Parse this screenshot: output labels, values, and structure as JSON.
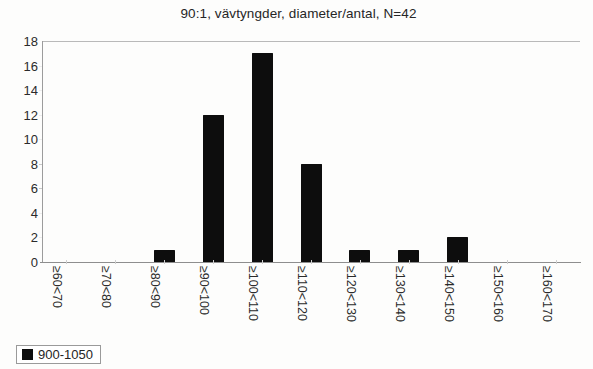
{
  "chart_data": {
    "type": "bar",
    "title": "90:1, vävtyngder, diameter/antal, N=42",
    "xlabel": "",
    "ylabel": "",
    "categories": [
      "≥60<70",
      "≥70<80",
      "≥80<90",
      "≥90<100",
      "≥100<110",
      "≥110<120",
      "≥120<130",
      "≥130<140",
      "≥140<150",
      "≥150<160",
      "≥160<170"
    ],
    "values": [
      0,
      0,
      1,
      12,
      17,
      8,
      1,
      1,
      2,
      0,
      0
    ],
    "series": [
      {
        "name": "900-1050",
        "values": [
          0,
          0,
          1,
          12,
          17,
          8,
          1,
          1,
          2,
          0,
          0
        ]
      }
    ],
    "ylim": [
      0,
      18
    ],
    "ytick_labels": [
      "0",
      "2",
      "4",
      "6",
      "8",
      "10",
      "12",
      "14",
      "16",
      "18"
    ],
    "ytick_values": [
      0,
      2,
      4,
      6,
      8,
      10,
      12,
      14,
      16,
      18
    ],
    "grid": false,
    "legend": {
      "position": "bottom-left",
      "entries": [
        {
          "label": "900-1050",
          "color": "#0d0d0d",
          "marker": "square-marker-icon"
        }
      ]
    },
    "bar_color": "#0d0d0d",
    "total_count": 42
  }
}
